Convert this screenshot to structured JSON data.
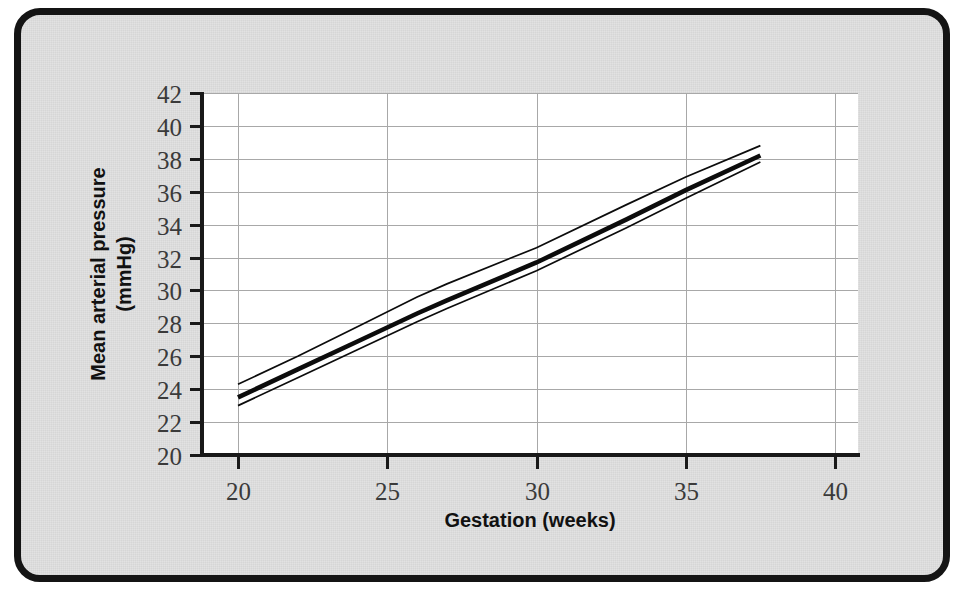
{
  "figure": {
    "background_color": "#e2e2e2",
    "border_color": "#141414",
    "plot_background_color": "#ffffff",
    "gridline_color": "#a8a8a8",
    "line_color": "#0c0c0c"
  },
  "chart_data": {
    "type": "line",
    "title": "",
    "xlabel": "Gestation (weeks)",
    "ylabel": "Mean arterial pressure (mmHg)",
    "ylabel_lines": [
      "Mean arterial pressure",
      "(mmHg)"
    ],
    "xlim": [
      19,
      41
    ],
    "ylim": [
      20,
      42
    ],
    "xticks": [
      20,
      25,
      30,
      35,
      40
    ],
    "xtick_labels": [
      "20",
      "25",
      "30",
      "35",
      "40"
    ],
    "yticks": [
      20,
      22,
      24,
      26,
      28,
      30,
      32,
      34,
      36,
      38,
      40,
      42
    ],
    "ytick_labels": [
      "20",
      "22",
      "24",
      "26",
      "28",
      "30",
      "32",
      "34",
      "36",
      "38",
      "40",
      "42"
    ],
    "grid": true,
    "grid_axis": "both",
    "legend": false,
    "legend_position": "none",
    "x": [
      20,
      22,
      24,
      26,
      27,
      30,
      33,
      35,
      37.5
    ],
    "series": [
      {
        "name": "Upper bound",
        "style": "thin",
        "values": [
          24.3,
          26.0,
          27.8,
          29.6,
          30.4,
          32.6,
          35.2,
          36.9,
          38.8
        ]
      },
      {
        "name": "Mean",
        "style": "thick",
        "values": [
          23.5,
          25.2,
          26.9,
          28.6,
          29.4,
          31.7,
          34.3,
          36.1,
          38.2
        ]
      },
      {
        "name": "Lower bound",
        "style": "thin",
        "values": [
          23.0,
          24.7,
          26.4,
          28.1,
          28.9,
          31.2,
          33.8,
          35.6,
          37.8
        ]
      }
    ]
  }
}
